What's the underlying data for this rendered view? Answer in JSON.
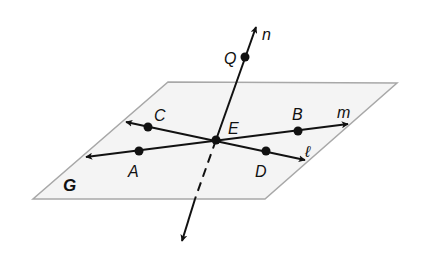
{
  "diagram": {
    "type": "geometry-plane-lines",
    "colors": {
      "background": "#ffffff",
      "plane_fill": "#f4f4f4",
      "plane_edge": "#a8a8a8",
      "ink": "#111111"
    },
    "plane": {
      "label": "G",
      "corners": [
        [
          168,
          82
        ],
        [
          397,
          83
        ],
        [
          265,
          199
        ],
        [
          33,
          199
        ]
      ]
    },
    "intersection_point": {
      "label": "E",
      "at": [
        216,
        140
      ]
    },
    "lines": [
      {
        "name": "n",
        "label": "n",
        "description": "line through Q and E, piercing plane G",
        "points": [
          "Q",
          "E"
        ]
      },
      {
        "name": "m",
        "label": "m",
        "description": "line through A, E, B in plane G",
        "points": [
          "A",
          "E",
          "B"
        ]
      },
      {
        "name": "l",
        "label": "ℓ",
        "description": "line through C, E, D in plane G",
        "points": [
          "C",
          "E",
          "D"
        ]
      }
    ],
    "points": [
      {
        "label": "Q",
        "at": [
          245,
          57
        ]
      },
      {
        "label": "C",
        "at": [
          148,
          127
        ]
      },
      {
        "label": "A",
        "at": [
          139,
          151
        ]
      },
      {
        "label": "B",
        "at": [
          298,
          131
        ]
      },
      {
        "label": "D",
        "at": [
          266,
          151
        ]
      },
      {
        "label": "E",
        "at": [
          216,
          140
        ]
      }
    ],
    "labels": {
      "n": "n",
      "Q": "Q",
      "C": "C",
      "E": "E",
      "B": "B",
      "m": "m",
      "l": "ℓ",
      "A": "A",
      "D": "D",
      "G": "G"
    }
  }
}
